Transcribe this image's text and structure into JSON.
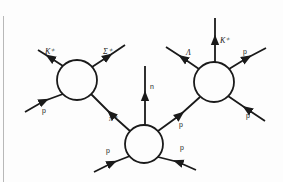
{
  "diagram": {
    "colors": {
      "line": "#1a1a1a",
      "background": "#fdfdfd",
      "border": "#b8b8b8"
    },
    "vertices": [
      {
        "id": "left-vertex",
        "center": [
          77,
          80
        ],
        "radius": 20,
        "legs": [
          {
            "label": "K⁺",
            "direction": "out",
            "to": [
              38,
              55
            ]
          },
          {
            "label": "Σ⁺",
            "direction": "out",
            "to": [
              126,
              45
            ]
          },
          {
            "label": "p",
            "direction": "in",
            "from": [
              25,
              110
            ]
          }
        ]
      },
      {
        "id": "middle-vertex",
        "center": [
          144,
          144
        ],
        "radius": 19,
        "legs": [
          {
            "label": "π⁺",
            "direction": "in",
            "from": "left-vertex"
          },
          {
            "label": "n",
            "direction": "out",
            "to": [
              145,
              66
            ]
          },
          {
            "label": "p",
            "direction": "out",
            "to": "right-vertex"
          },
          {
            "label": "p",
            "direction": "in",
            "from": [
              94,
              170
            ]
          },
          {
            "label": "p",
            "direction": "in",
            "from": [
              196,
              170
            ]
          }
        ]
      },
      {
        "id": "right-vertex",
        "center": [
          214,
          82
        ],
        "radius": 20,
        "legs": [
          {
            "label": "Λ",
            "direction": "out",
            "to": [
              166,
              48
            ]
          },
          {
            "label": "K⁺",
            "direction": "out",
            "to": [
              215,
              18
            ]
          },
          {
            "label": "p",
            "direction": "out",
            "to": [
              266,
              48
            ]
          },
          {
            "label": "p",
            "direction": "in",
            "from": [
              264,
              121
            ]
          }
        ]
      }
    ],
    "labels": {
      "k_plus_left": "K⁺",
      "sigma_plus": "Σ⁺",
      "p_left": "p",
      "pi_plus": "π⁺",
      "n": "n",
      "p_mid_in": "p",
      "p_mid_out": "p",
      "lambda": "Λ",
      "k_plus_right": "K⁺",
      "p_right_out": "p",
      "p_right_in": "p"
    }
  }
}
